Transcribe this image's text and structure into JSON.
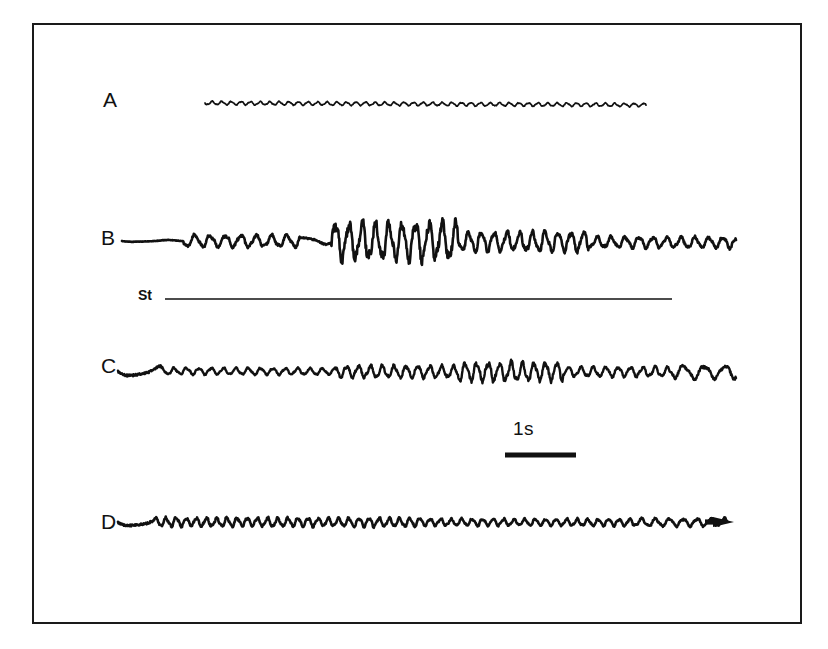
{
  "figure": {
    "kind": "electrophysiology-recording-panel",
    "background_color": "#ffffff",
    "trace_color": "#111111",
    "frame": {
      "border_color": "#1a1a1a",
      "x": 32,
      "y": 23,
      "width": 770,
      "height": 601
    }
  },
  "labels": {
    "trace_a": "A",
    "trace_b": "B",
    "trace_c": "C",
    "trace_d": "D",
    "stimulus": "St",
    "scalebar": "1s"
  },
  "scalebar": {
    "text": "1s",
    "x_start": 505,
    "x_end": 576,
    "y": 455,
    "thickness": 5
  },
  "stimulus_marker": {
    "label": "St",
    "x_start": 165,
    "x_end": 672,
    "y": 299,
    "thickness": 1.6
  },
  "chart_data": {
    "type": "line",
    "title": "",
    "xlabel": "",
    "ylabel": "",
    "grid": false,
    "legend_position": "none",
    "time_scale_bar_seconds": 1,
    "time_scale_bar_pixels": 71,
    "series": [
      {
        "name": "A",
        "label": "A",
        "x_start": 205,
        "x_end": 646,
        "baseline_y": 103,
        "stroke_width": 1.7,
        "segments": [
          {
            "from": 0.0,
            "to": 1.0,
            "amplitude": 1.6,
            "frequency": 46,
            "drift": 2.0
          }
        ],
        "description": "low-amplitude flat trace with slight ripple and downward drift"
      },
      {
        "name": "B",
        "label": "B",
        "x_start": 122,
        "x_end": 736,
        "baseline_y": 241,
        "stroke_width": 2.6,
        "segments": [
          {
            "from": 0.0,
            "to": 0.1,
            "amplitude": 0.8,
            "frequency": 10,
            "drift": 0.0
          },
          {
            "from": 0.1,
            "to": 0.29,
            "amplitude": 5.5,
            "frequency": 40,
            "drift": 0.0
          },
          {
            "from": 0.29,
            "to": 0.34,
            "amplitude": 3.0,
            "frequency": 16,
            "drift": -1.0
          },
          {
            "from": 0.34,
            "to": 0.55,
            "amplitude": 17.0,
            "frequency": 46,
            "drift": 0.0
          },
          {
            "from": 0.55,
            "to": 0.76,
            "amplitude": 9.0,
            "frequency": 48,
            "drift": 1.0
          },
          {
            "from": 0.76,
            "to": 1.0,
            "amplitude": 5.0,
            "frequency": 44,
            "drift": 1.5
          }
        ],
        "description": "quiet baseline then stimulus-evoked high-amplitude burst decaying to small oscillation"
      },
      {
        "name": "C",
        "label": "C",
        "x_start": 118,
        "x_end": 736,
        "baseline_y": 371,
        "stroke_width": 2.4,
        "segments": [
          {
            "from": 0.0,
            "to": 0.07,
            "amplitude": 5.0,
            "frequency": 10,
            "drift": 0.0
          },
          {
            "from": 0.07,
            "to": 0.35,
            "amplitude": 3.0,
            "frequency": 50,
            "drift": 1.5
          },
          {
            "from": 0.35,
            "to": 0.55,
            "amplitude": 5.5,
            "frequency": 52,
            "drift": 1.5
          },
          {
            "from": 0.55,
            "to": 0.72,
            "amplitude": 8.5,
            "frequency": 54,
            "drift": 1.0
          },
          {
            "from": 0.72,
            "to": 0.9,
            "amplitude": 4.5,
            "frequency": 50,
            "drift": 1.0
          },
          {
            "from": 0.9,
            "to": 1.0,
            "amplitude": 6.0,
            "frequency": 30,
            "drift": 1.0
          }
        ],
        "description": "continuous rhythmic oscillation with mid-trace amplitude increase"
      },
      {
        "name": "D",
        "label": "D",
        "x_start": 118,
        "x_end": 727,
        "baseline_y": 522,
        "stroke_width": 2.6,
        "arrow_end": true,
        "segments": [
          {
            "from": 0.0,
            "to": 0.06,
            "amplitude": 4.0,
            "frequency": 10,
            "drift": 0.0
          },
          {
            "from": 0.06,
            "to": 0.5,
            "amplitude": 4.0,
            "frequency": 60,
            "drift": 0.5
          },
          {
            "from": 0.5,
            "to": 0.85,
            "amplitude": 3.2,
            "frequency": 58,
            "drift": 0.5
          },
          {
            "from": 0.85,
            "to": 1.0,
            "amplitude": 3.6,
            "frequency": 44,
            "drift": 0.5
          }
        ],
        "description": "uniform small-amplitude rhythmic oscillation ending in an arrowhead marker"
      }
    ]
  }
}
